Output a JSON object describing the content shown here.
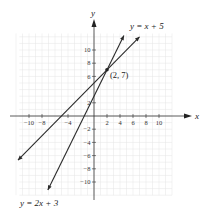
{
  "chart_data": {
    "type": "line",
    "title": "",
    "xlabel": "x",
    "ylabel": "y",
    "xlim": [
      -12,
      12
    ],
    "ylim": [
      -12,
      12
    ],
    "grid": true,
    "x_ticks": [
      -10,
      -8,
      -4,
      2,
      4,
      6,
      8,
      10
    ],
    "x_tick_labels": [
      "−10",
      "−8",
      "−4",
      "2",
      "4",
      "6",
      "8",
      "10"
    ],
    "y_ticks": [
      10,
      8,
      6,
      2,
      -2,
      -4,
      -6,
      -8,
      -10
    ],
    "y_tick_labels": [
      "10",
      "8",
      "6",
      "2",
      "−2",
      "−4",
      "−6",
      "−8",
      "−10"
    ],
    "series": [
      {
        "name": "y = x + 5",
        "slope": 1,
        "intercept": 5,
        "x": [
          -11.7,
          7.0
        ],
        "y": [
          -6.7,
          12.0
        ]
      },
      {
        "name": "y = 2x + 3",
        "slope": 2,
        "intercept": 3,
        "x": [
          -7.1,
          4.6
        ],
        "y": [
          -11.2,
          12.2
        ]
      }
    ],
    "annotations": [
      {
        "text": "(2, 7)",
        "x": 2,
        "y": 7,
        "type": "intersection-point"
      }
    ],
    "legend": "inline labels at line ends"
  },
  "labels": {
    "x_axis": "x",
    "y_axis": "y",
    "line1": "y = x + 5",
    "line2": "y = 2x + 3",
    "point": "(2, 7)"
  }
}
